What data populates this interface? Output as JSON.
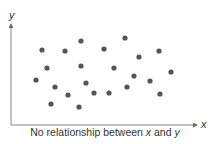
{
  "chart_data": {
    "type": "scatter",
    "title": "",
    "caption_parts": [
      "No relationship between ",
      "x",
      " and ",
      "y"
    ],
    "xlabel": "x",
    "ylabel": "y",
    "grid": false,
    "ticks": false,
    "points": [
      [
        42,
        50
      ],
      [
        65,
        51
      ],
      [
        81,
        41
      ],
      [
        104,
        49
      ],
      [
        125,
        38
      ],
      [
        139,
        57
      ],
      [
        159,
        51
      ],
      [
        47,
        68
      ],
      [
        81,
        66
      ],
      [
        114,
        68
      ],
      [
        171,
        72
      ],
      [
        36,
        80
      ],
      [
        55,
        87
      ],
      [
        86,
        83
      ],
      [
        134,
        76
      ],
      [
        150,
        81
      ],
      [
        68,
        95
      ],
      [
        94,
        93
      ],
      [
        109,
        93
      ],
      [
        127,
        87
      ],
      [
        160,
        94
      ],
      [
        51,
        104
      ],
      [
        79,
        107
      ]
    ],
    "point_coordinate_space": "pixels (x right, y down)",
    "colors": {
      "points": "#555555",
      "axes": "#888888",
      "text": "#333333"
    }
  }
}
